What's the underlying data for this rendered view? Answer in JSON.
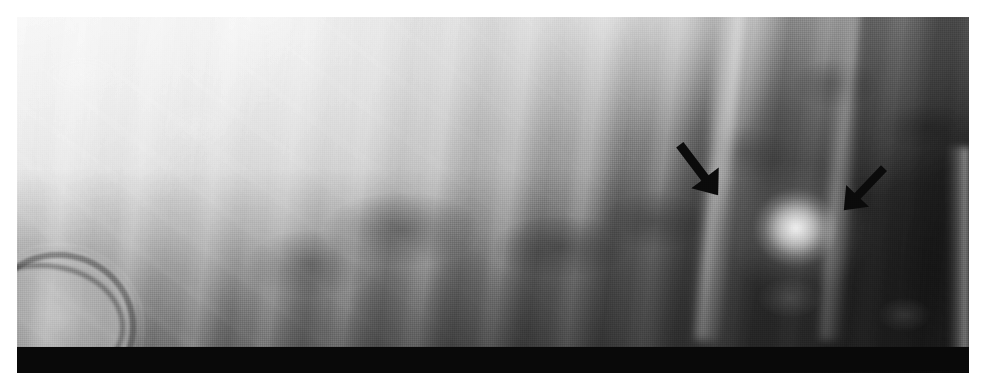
{
  "figure": {
    "kind": "radiograph",
    "modality_label": "plain film radiograph",
    "caption": "",
    "plate": {
      "left": 17,
      "top": 17,
      "width": 952,
      "height": 356,
      "background_color": "#8a8a8a",
      "page_background_color": "#ffffff"
    },
    "rendering": {
      "halftone": "true",
      "grayscale": "true",
      "dot_pitch_px": 2
    }
  },
  "annotations": {
    "count": 2,
    "color": "#0d0d0d",
    "items": [
      {
        "name": "arrow-left",
        "label": "",
        "direction": "down-right",
        "tail_x": 700,
        "tail_y": 137,
        "tip_x": 740,
        "tip_y": 190,
        "points_to": "lesion"
      },
      {
        "name": "arrow-right",
        "label": "",
        "direction": "down-left",
        "tail_x": 864,
        "tail_y": 160,
        "tip_x": 822,
        "tip_y": 204,
        "points_to": "lesion"
      }
    ]
  },
  "findings": {
    "lesion": {
      "name": "focal-opacity",
      "label": "",
      "center_x": 796,
      "center_y": 228,
      "radius_x": 52,
      "radius_y": 48,
      "appearance": "rounded radiodense opacity"
    },
    "gas_arc": {
      "name": "curvilinear-lucency",
      "label": "",
      "center_x": 34,
      "center_y": 303
    }
  },
  "regions": [
    {
      "name": "upper-left-soft-tissue",
      "tone": "bright",
      "hex": "#f2f2f2"
    },
    {
      "name": "rib-bands",
      "tone": "alternating",
      "hex": "#c9c9c9"
    },
    {
      "name": "intercostal-spaces",
      "tone": "mid-dark",
      "hex": "#6b6b6b"
    },
    {
      "name": "right-field",
      "tone": "dark",
      "hex": "#333333"
    },
    {
      "name": "lower-band",
      "tone": "dark",
      "hex": "#4a4a4a"
    },
    {
      "name": "bottom-bar",
      "tone": "black",
      "hex": "#090909"
    }
  ]
}
